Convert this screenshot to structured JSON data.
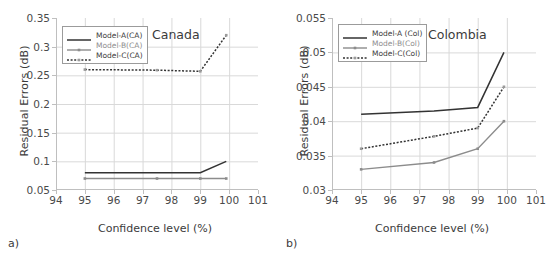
{
  "figure": {
    "panels": [
      {
        "caption": "a)",
        "title": "Canada",
        "legend": [
          {
            "label": "Model-A(CA)",
            "style": "solid-dark"
          },
          {
            "label": "Model-B(CA)",
            "style": "solid-gray"
          },
          {
            "label": "Model-C(CA)",
            "style": "dotted-dark"
          }
        ],
        "chart": {
          "type": "line",
          "title": "Canada",
          "xlabel": "Confidence level (%)",
          "ylabel": "Residual Errors (dB)",
          "xlim": [
            94,
            101
          ],
          "ylim": [
            0.05,
            0.35
          ],
          "xticks": [
            94,
            95,
            96,
            97,
            98,
            99,
            100,
            101
          ],
          "yticks": [
            0.05,
            0.1,
            0.15,
            0.2,
            0.25,
            0.3,
            0.35
          ],
          "ytick_labels": [
            "0.05",
            "0.1",
            "0.15",
            "0.2",
            "0.25",
            "0.3",
            "0.35"
          ],
          "grid": true,
          "legend_position": "upper-left",
          "x": [
            95,
            97.5,
            99,
            99.9
          ],
          "series": [
            {
              "name": "Model-A(CA)",
              "values": [
                0.08,
                0.08,
                0.08,
                0.1
              ]
            },
            {
              "name": "Model-B(CA)",
              "values": [
                0.07,
                0.07,
                0.07,
                0.07
              ]
            },
            {
              "name": "Model-C(CA)",
              "values": [
                0.26,
                0.259,
                0.257,
                0.32
              ]
            }
          ]
        }
      },
      {
        "caption": "b)",
        "title": "Colombia",
        "legend": [
          {
            "label": "Model-A (Col)",
            "style": "solid-dark"
          },
          {
            "label": "Model-B(Col)",
            "style": "solid-gray"
          },
          {
            "label": "Model-C(Col)",
            "style": "dotted-dark"
          }
        ],
        "chart": {
          "type": "line",
          "title": "Colombia",
          "xlabel": "Confidence level (%)",
          "ylabel": "Residual Errors (dB)",
          "xlim": [
            94,
            101
          ],
          "ylim": [
            0.03,
            0.055
          ],
          "xticks": [
            94,
            95,
            96,
            97,
            98,
            99,
            100,
            101
          ],
          "yticks": [
            0.03,
            0.035,
            0.04,
            0.045,
            0.05,
            0.055
          ],
          "ytick_labels": [
            "0.03",
            "0.035",
            "0.04",
            "0.045",
            "0.05",
            "0.055"
          ],
          "grid": true,
          "legend_position": "upper-left",
          "x": [
            95,
            97.5,
            99,
            99.9
          ],
          "series": [
            {
              "name": "Model-A (Col)",
              "values": [
                0.041,
                0.0415,
                0.042,
                0.05
              ]
            },
            {
              "name": "Model-B(Col)",
              "values": [
                0.033,
                0.034,
                0.036,
                0.04
              ]
            },
            {
              "name": "Model-C(Col)",
              "values": [
                0.036,
                0.0378,
                0.039,
                0.045
              ]
            }
          ]
        }
      }
    ],
    "colors": {
      "dark": "#333333",
      "gray": "#8c8c8c",
      "grid": "#d9d9d9",
      "axis": "#bfbfbf",
      "text": "#3b3b3b"
    }
  }
}
